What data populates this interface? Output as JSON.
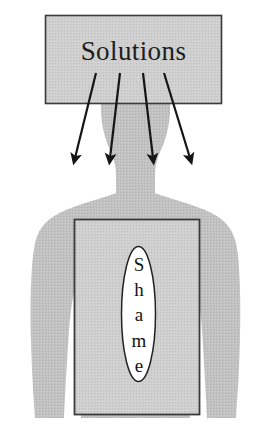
{
  "diagram": {
    "title_box": {
      "label": "Solutions",
      "shape": "rectangle",
      "fill_color": "#cccccc",
      "stroke_color": "#333333"
    },
    "arrows": {
      "count": 4,
      "direction": "down-outward",
      "color": "#1a1a1a",
      "semantic": "solutions-deflected-away"
    },
    "figure": {
      "name": "human-silhouette",
      "fill_color": "#bfbfbf"
    },
    "body_box": {
      "shape": "rectangle",
      "fill_color": "#cccccc",
      "stroke_color": "#333333"
    },
    "core_oval": {
      "label": "Shame",
      "letters": [
        "S",
        "h",
        "a",
        "m",
        "e"
      ],
      "shape": "ellipse",
      "fill_color": "#ffffff",
      "stroke_color": "#222222",
      "orientation": "vertical"
    }
  }
}
